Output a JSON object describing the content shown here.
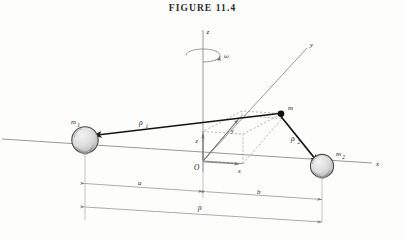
{
  "figure": {
    "title": "FIGURE 11.4",
    "caption_number": "11.4"
  },
  "axes": {
    "z_label": "z",
    "y_label": "y",
    "x_label": "x",
    "origin_label": "O",
    "angular_velocity_label": "ω"
  },
  "components": {
    "x_component_label": "x",
    "y_component_label": "y",
    "z_component_label": "z"
  },
  "masses": {
    "m1": {
      "label": "m",
      "subscript": "1"
    },
    "m2": {
      "label": "m",
      "subscript": "2"
    },
    "m": {
      "label": "m"
    }
  },
  "vectors": {
    "rho1": {
      "label": "ρ",
      "subscript": "1"
    },
    "rho2": {
      "label": "ρ",
      "subscript": "2"
    }
  },
  "dimensions": {
    "a": "a",
    "b": "b",
    "rho": "ρ"
  },
  "colors": {
    "background": "#fdfdfc",
    "ink": "#232323",
    "thin_line": "#8d8d8d",
    "dashed_line": "#9a9a9a",
    "dimension_line": "#8a8a8a",
    "sphere_fill": "#d9d9d9",
    "sphere_stroke": "#4a4a4a",
    "point_mass": "#111111"
  }
}
